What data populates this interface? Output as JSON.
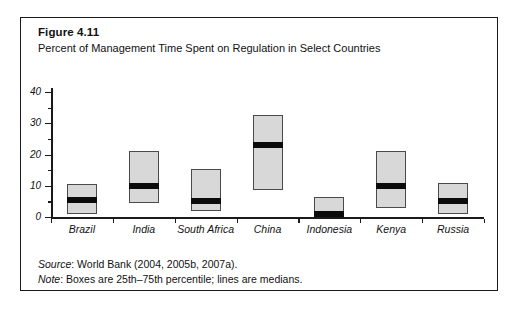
{
  "figure": {
    "title": "Figure 4.11",
    "subtitle": "Percent of Management Time Spent on Regulation in Select Countries",
    "source_label": "Source",
    "source_rest": ": World Bank (2004, 2005b, 2007a).",
    "note_label": "Note",
    "note_rest": ": Boxes are 25th–75th percentile; lines are medians."
  },
  "chart_data": {
    "type": "box",
    "title": "Figure 4.11",
    "subtitle": "Percent of Management Time Spent on Regulation in Select Countries",
    "xlabel": "",
    "ylabel": "",
    "ylim": [
      0,
      40
    ],
    "y_major_ticks": [
      0,
      10,
      20,
      30,
      40
    ],
    "y_minor_ticks": [
      5,
      15,
      25,
      35
    ],
    "grid": false,
    "legend": "none",
    "categories": [
      "Brazil",
      "India",
      "South Africa",
      "China",
      "Indonesia",
      "Kenya",
      "Russia"
    ],
    "boxes": [
      {
        "country": "Brazil",
        "p25": 1,
        "median": 5.5,
        "p75": 10.5
      },
      {
        "country": "India",
        "p25": 4.5,
        "median": 10,
        "p75": 21
      },
      {
        "country": "South Africa",
        "p25": 2,
        "median": 5,
        "p75": 15.5
      },
      {
        "country": "China",
        "p25": 8.5,
        "median": 23,
        "p75": 32.5
      },
      {
        "country": "Indonesia",
        "p25": 0,
        "median": 1,
        "p75": 6.5
      },
      {
        "country": "Kenya",
        "p25": 3,
        "median": 10,
        "p75": 21
      },
      {
        "country": "Russia",
        "p25": 1,
        "median": 5,
        "p75": 11
      }
    ],
    "note": "Boxes are 25th–75th percentile; lines are medians.",
    "source": "World Bank (2004, 2005b, 2007a)."
  },
  "colors": {
    "background": "#ffffff",
    "frame_border": "#1a1a1a",
    "axis": "#1a1a1a",
    "box_fill": "#d8d8d8",
    "box_border": "#4a4a4a",
    "median": "#0b0b0b"
  }
}
